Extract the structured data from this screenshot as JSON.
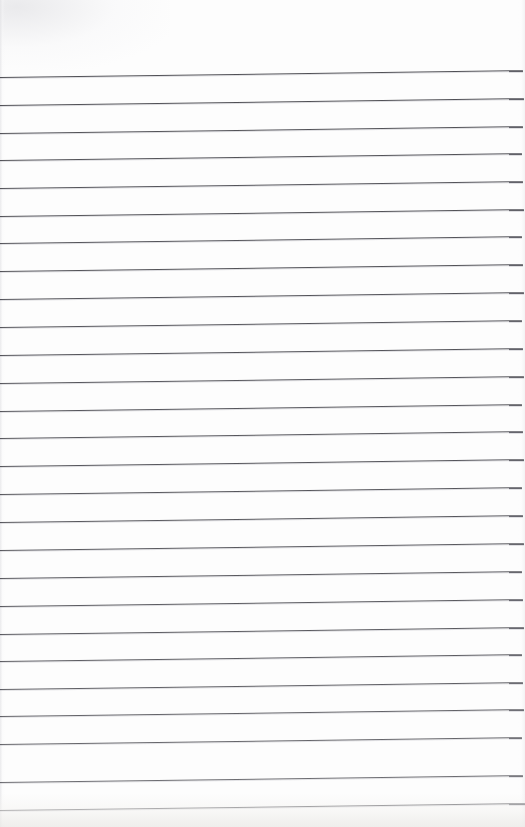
{
  "document": {
    "kind": "scanned-lined-notepad-page",
    "title": "Blank Ruled Notepad Page",
    "page_width": 525,
    "page_height": 827,
    "background_color": "#fdfdfd",
    "has_text_content": false,
    "has_margin_rule": false,
    "has_header": false,
    "has_footer": false,
    "has_holes": false,
    "handwriting": "",
    "typed_text": "",
    "page_number": "",
    "notes": ""
  },
  "ruling": {
    "line_color": "#4a4a50",
    "line_thickness_px": 1,
    "line_count": 27,
    "spacing_px": 27.7,
    "first_line_y_left": 77,
    "last_line_y_left": 810,
    "skew_degrees": -0.75,
    "left_inset_px": 0,
    "right_inset_px": 4,
    "lines": [
      {
        "index": 1,
        "y_left": 77,
        "opacity": 0.96,
        "width": 523
      },
      {
        "index": 2,
        "y_left": 105,
        "opacity": 0.96,
        "width": 524
      },
      {
        "index": 3,
        "y_left": 133,
        "opacity": 0.95,
        "width": 523
      },
      {
        "index": 4,
        "y_left": 160,
        "opacity": 0.95,
        "width": 522
      },
      {
        "index": 5,
        "y_left": 188,
        "opacity": 0.94,
        "width": 523
      },
      {
        "index": 6,
        "y_left": 216,
        "opacity": 0.95,
        "width": 524
      },
      {
        "index": 7,
        "y_left": 243,
        "opacity": 0.94,
        "width": 522
      },
      {
        "index": 8,
        "y_left": 271,
        "opacity": 0.95,
        "width": 523
      },
      {
        "index": 9,
        "y_left": 299,
        "opacity": 0.94,
        "width": 524
      },
      {
        "index": 10,
        "y_left": 327,
        "opacity": 0.93,
        "width": 522
      },
      {
        "index": 11,
        "y_left": 355,
        "opacity": 0.94,
        "width": 523
      },
      {
        "index": 12,
        "y_left": 383,
        "opacity": 0.93,
        "width": 524
      },
      {
        "index": 13,
        "y_left": 411,
        "opacity": 0.93,
        "width": 522
      },
      {
        "index": 14,
        "y_left": 438,
        "opacity": 0.92,
        "width": 523
      },
      {
        "index": 15,
        "y_left": 466,
        "opacity": 0.93,
        "width": 524
      },
      {
        "index": 16,
        "y_left": 494,
        "opacity": 0.92,
        "width": 522
      },
      {
        "index": 17,
        "y_left": 522,
        "opacity": 0.92,
        "width": 523
      },
      {
        "index": 18,
        "y_left": 550,
        "opacity": 0.91,
        "width": 524
      },
      {
        "index": 19,
        "y_left": 578,
        "opacity": 0.91,
        "width": 522
      },
      {
        "index": 20,
        "y_left": 606,
        "opacity": 0.9,
        "width": 523
      },
      {
        "index": 21,
        "y_left": 634,
        "opacity": 0.9,
        "width": 524
      },
      {
        "index": 22,
        "y_left": 661,
        "opacity": 0.89,
        "width": 522
      },
      {
        "index": 23,
        "y_left": 689,
        "opacity": 0.88,
        "width": 523
      },
      {
        "index": 24,
        "y_left": 716,
        "opacity": 0.86,
        "width": 524
      },
      {
        "index": 25,
        "y_left": 744,
        "opacity": 0.84,
        "width": 522
      },
      {
        "index": 26,
        "y_left": 782,
        "opacity": 0.8,
        "width": 523
      },
      {
        "index": 27,
        "y_left": 810,
        "opacity": 0.78,
        "width": 525
      }
    ]
  }
}
